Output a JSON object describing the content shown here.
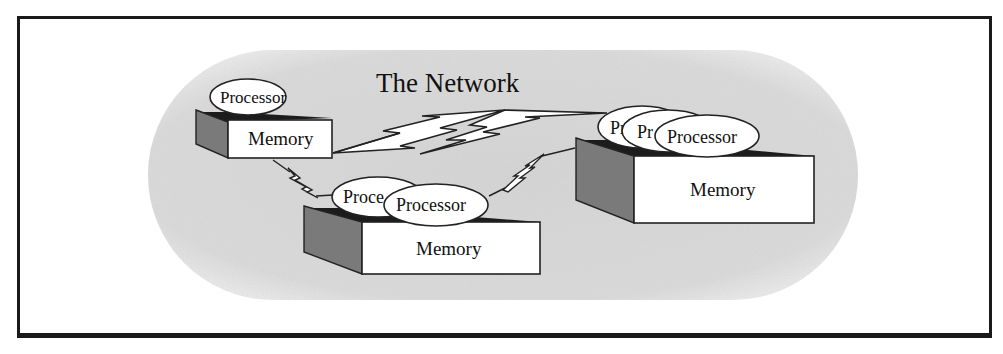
{
  "diagram": {
    "title": "The Network",
    "colors": {
      "frame": "#1a1a1a",
      "network_cloud": "#dcdcdc",
      "box_front": "#ffffff",
      "box_side": "#7a7a7a",
      "box_top": "#1c1c1c",
      "processor_fill": "#ffffff",
      "outline": "#222222"
    },
    "nodes": [
      {
        "id": "node-small",
        "memory_label": "Memory",
        "processors": [
          "Processor"
        ]
      },
      {
        "id": "node-medium",
        "memory_label": "Memory",
        "processors": [
          "Proce",
          "Processor"
        ]
      },
      {
        "id": "node-large",
        "memory_label": "Memory",
        "processors": [
          "Pr",
          "Pr",
          "Processor"
        ]
      }
    ],
    "links": [
      {
        "from": "node-small",
        "to": "node-large",
        "style": "lightning-large"
      },
      {
        "from": "node-small",
        "to": "node-medium",
        "style": "lightning-small"
      },
      {
        "from": "node-medium",
        "to": "node-large",
        "style": "lightning-small"
      }
    ]
  }
}
